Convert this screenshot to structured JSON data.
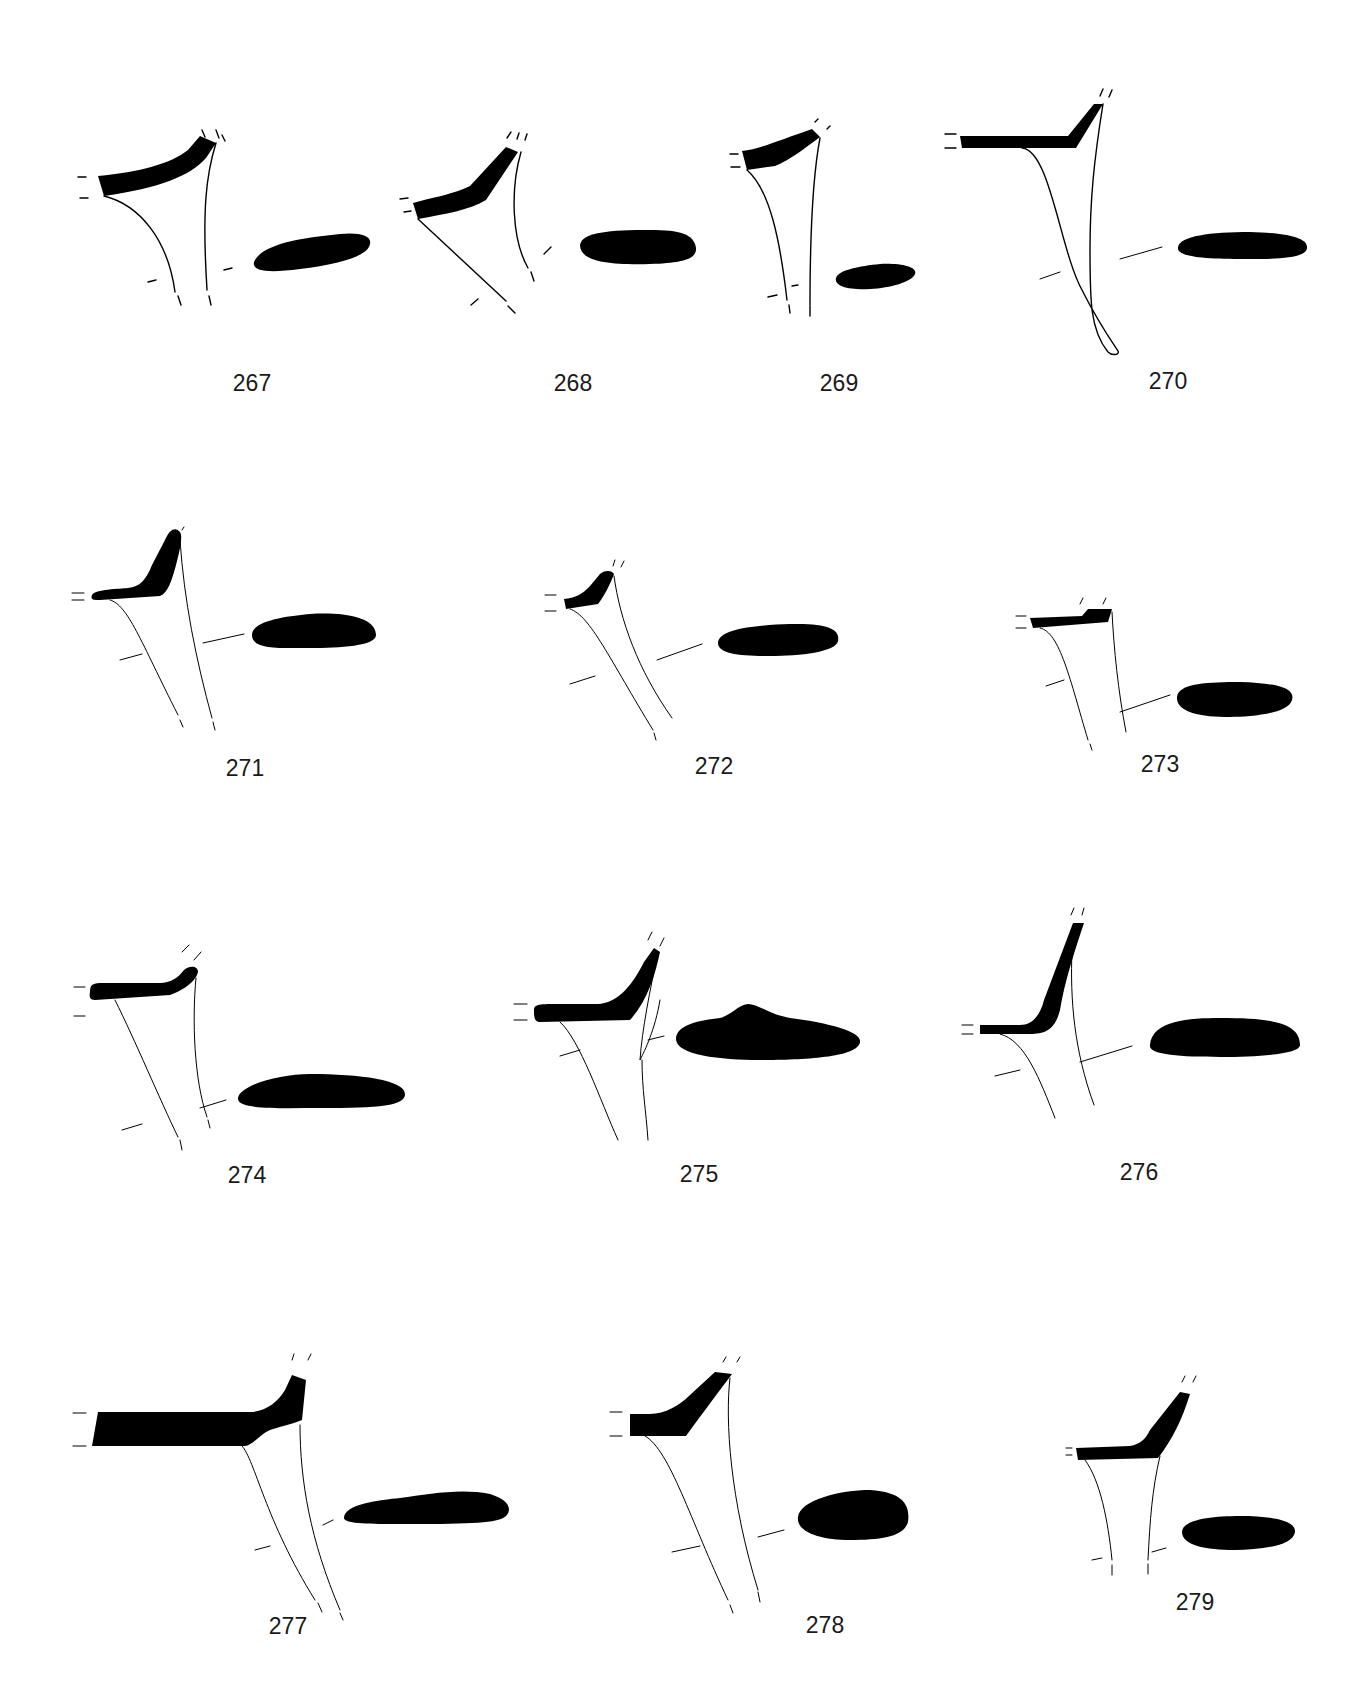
{
  "plate": {
    "background": "#ffffff",
    "ink_color": "#000000",
    "figures": [
      {
        "number": "267",
        "label_x": 252,
        "label_y": 372
      },
      {
        "number": "268",
        "label_x": 573,
        "label_y": 372
      },
      {
        "number": "269",
        "label_x": 839,
        "label_y": 372
      },
      {
        "number": "270",
        "label_x": 1168,
        "label_y": 370
      },
      {
        "number": "271",
        "label_x": 245,
        "label_y": 757
      },
      {
        "number": "272",
        "label_x": 714,
        "label_y": 755
      },
      {
        "number": "273",
        "label_x": 1160,
        "label_y": 753
      },
      {
        "number": "274",
        "label_x": 247,
        "label_y": 1164
      },
      {
        "number": "275",
        "label_x": 699,
        "label_y": 1163
      },
      {
        "number": "276",
        "label_x": 1139,
        "label_y": 1161
      },
      {
        "number": "277",
        "label_x": 288,
        "label_y": 1615
      },
      {
        "number": "278",
        "label_x": 825,
        "label_y": 1614
      },
      {
        "number": "279",
        "label_x": 1195,
        "label_y": 1591
      }
    ]
  }
}
